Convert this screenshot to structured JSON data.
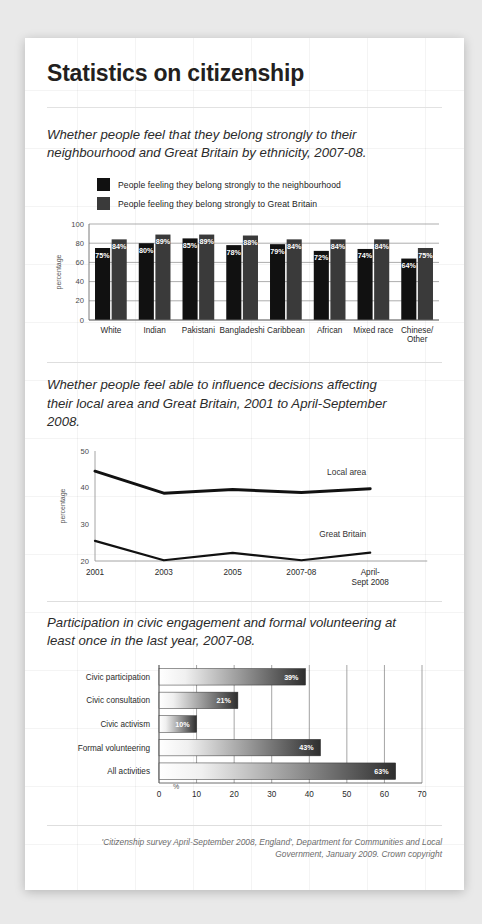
{
  "title": "Statistics on citizenship",
  "chart1": {
    "subtitle": "Whether people feel that they belong strongly to their neighbourhood and Great Britain by ethnicity, 2007-08.",
    "legend": [
      {
        "label": "People feeling they belong strongly to the neighbourhood",
        "color": "#111111"
      },
      {
        "label": "People feeling they belong strongly to Great Britain",
        "color": "#3a3a3a"
      }
    ]
  },
  "chart2": {
    "subtitle": "Whether people feel able to influence decisions affecting their local area and Great Britain, 2001 to April-September 2008."
  },
  "chart3": {
    "subtitle": "Participation in civic engagement and formal volunteering at least once in the last year, 2007-08."
  },
  "credit": {
    "line1": "'Citizenship survey April-September 2008, England', Department for Communities and Local",
    "line2": "Government, January 2009. Crown copyright"
  },
  "chart_data": [
    {
      "id": "belonging-by-ethnicity",
      "type": "bar",
      "title": "Whether people feel that they belong strongly to their neighbourhood and Great Britain by ethnicity, 2007-08.",
      "xlabel": "",
      "ylabel": "percentage",
      "ylim": [
        0,
        100
      ],
      "yticks": [
        0,
        20,
        40,
        60,
        80,
        100
      ],
      "grid": true,
      "legend_position": "top-left",
      "categories": [
        "White",
        "Indian",
        "Pakistani",
        "Bangladeshi",
        "Caribbean",
        "African",
        "Mixed race",
        "Chinese/\nOther"
      ],
      "category_labels": [
        "White",
        "Indian",
        "Pakistani",
        "Bangladeshi",
        "Caribbean",
        "African",
        "Mixed race",
        "Chinese/ Other"
      ],
      "series": [
        {
          "name": "People feeling they belong strongly to the neighbourhood",
          "color": "#111111",
          "values": [
            75,
            80,
            85,
            78,
            79,
            72,
            74,
            64
          ],
          "labels": [
            "75%",
            "80%",
            "85%",
            "78%",
            "79%",
            "72%",
            "74%",
            "64%"
          ]
        },
        {
          "name": "People feeling they belong strongly to Great Britain",
          "color": "#3a3a3a",
          "values": [
            84,
            89,
            89,
            88,
            84,
            84,
            84,
            75
          ],
          "labels": [
            "84%",
            "89%",
            "89%",
            "88%",
            "84%",
            "84%",
            "84%",
            "75%"
          ]
        }
      ]
    },
    {
      "id": "influence-decisions",
      "type": "line",
      "title": "Whether people feel able to influence decisions affecting their local area and Great Britain, 2001 to April-September 2008.",
      "xlabel": "",
      "ylabel": "percentage",
      "ylim": [
        20,
        50
      ],
      "yticks": [
        20,
        30,
        40,
        50
      ],
      "grid": false,
      "legend_position": "inline-right",
      "x": [
        "2001",
        "2003",
        "2005",
        "2007-08",
        "April-\nSept 2008"
      ],
      "x_labels": [
        "2001",
        "2003",
        "2005",
        "2007-08",
        "April- Sept 2008"
      ],
      "series": [
        {
          "name": "Local area",
          "color": "#111111",
          "values": [
            44.5,
            38.5,
            39.5,
            38.7,
            39.7
          ]
        },
        {
          "name": "Great Britain",
          "color": "#111111",
          "values": [
            25.5,
            20.2,
            22.2,
            20.2,
            22.3
          ]
        }
      ]
    },
    {
      "id": "civic-participation",
      "type": "bar",
      "orientation": "horizontal",
      "title": "Participation in civic engagement and formal volunteering at least once in the last year, 2007-08.",
      "xlabel": "%",
      "ylabel": "",
      "xlim": [
        0,
        70
      ],
      "xticks": [
        0,
        10,
        20,
        30,
        40,
        50,
        60,
        70
      ],
      "grid": true,
      "categories": [
        "Civic participation",
        "Civic consultation",
        "Civic activism",
        "Formal volunteering",
        "All activities"
      ],
      "values": [
        39,
        21,
        10,
        43,
        63
      ],
      "labels": [
        "39%",
        "21%",
        "10%",
        "43%",
        "63%"
      ],
      "bar_style": "gradient-light-to-dark"
    }
  ]
}
